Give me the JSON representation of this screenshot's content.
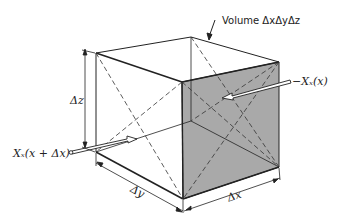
{
  "diagram": {
    "colors": {
      "line": "#222222",
      "face_shade": "#a8a8a8",
      "background": "#ffffff"
    },
    "labels": {
      "volume": "Volume ΔxΔyΔz",
      "force_left": "Xₓ(x + Δx)",
      "force_right": "−Xₓ(x)",
      "dz": "Δz",
      "dy": "Δy",
      "dx": "Δx"
    },
    "vertices": {
      "top_back_left": [
        96,
        53
      ],
      "top_back_right": [
        191,
        37
      ],
      "top_front_right": [
        279,
        62
      ],
      "top_front_left": [
        182,
        82
      ],
      "bottom_front_left": [
        183,
        199
      ],
      "bottom_front_right": [
        279,
        167
      ],
      "bottom_back_left": [
        96,
        152
      ],
      "bottom_back_right": [
        191,
        121
      ]
    },
    "elements": [
      {
        "type": "shaded-face",
        "name": "front-right-face"
      },
      {
        "type": "dashed-diagonals",
        "name": "face-diagonals"
      },
      {
        "type": "arrow",
        "name": "force-arrow-left",
        "label": "force_left"
      },
      {
        "type": "arrow",
        "name": "force-arrow-right",
        "label": "force_right"
      },
      {
        "type": "dimension",
        "name": "dz-dimension",
        "label": "dz"
      },
      {
        "type": "dimension",
        "name": "dy-dimension",
        "label": "dy"
      },
      {
        "type": "dimension",
        "name": "dx-dimension",
        "label": "dx"
      },
      {
        "type": "leader",
        "name": "volume-leader",
        "label": "volume"
      }
    ]
  }
}
